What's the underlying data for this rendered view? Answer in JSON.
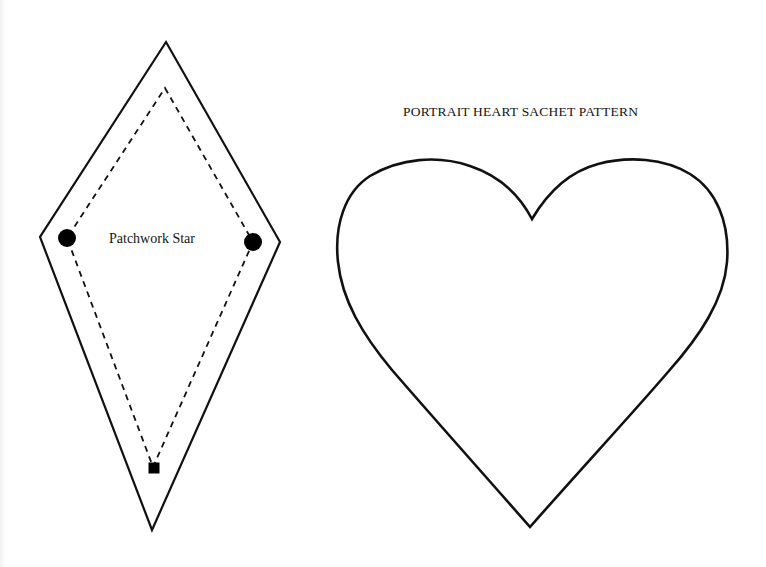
{
  "document": {
    "heart_pattern": {
      "title": "PORTRAIT HEART SACHET PATTERN",
      "shape": "heart-outline"
    },
    "star_pattern": {
      "label": "Patchwork Star",
      "shape": "diamond-outline",
      "seam_line": "dashed",
      "markers": [
        "circle-dot-left",
        "circle-dot-right",
        "square-dot-bottom"
      ]
    }
  },
  "colors": {
    "background": "#ffffff",
    "ink": "#111111"
  }
}
